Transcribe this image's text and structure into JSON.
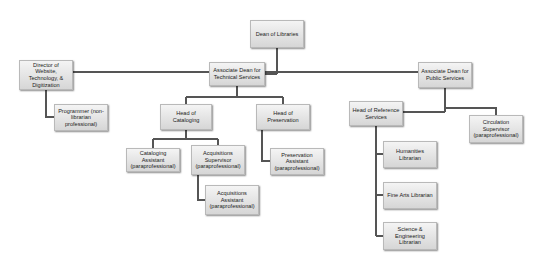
{
  "chart": {
    "line_color": "#555555",
    "box_fill_top": "#f4f4f4",
    "box_fill_bottom": "#d6d6d6",
    "nodes": {
      "dean": "Dean of Libraries",
      "director_web": "Director of Website, Technology, & Digitization",
      "programmer": "Programmer (non-librarian professional)",
      "assoc_dean_tech": "Associate Dean for Technical Services",
      "head_cataloging": "Head of Cataloging",
      "head_preservation": "Head of Preservation",
      "cataloging_assistant": "Cataloging Assistant (paraprofessional)",
      "acq_supervisor": "Acquisitions Supervisor (paraprofessional)",
      "preservation_assistant": "Preservation Assistant (paraprofessional)",
      "acq_assistant": "Acquisitions Assistant (paraprofessional)",
      "assoc_dean_public": "Associate Dean for Public Services",
      "head_reference": "Head of Reference Services",
      "circulation_supervisor": "Circulation Supervisor (paraprofessional)",
      "humanities_librarian": "Humanities Librarian",
      "fine_arts_librarian": "Fine Arts Librarian",
      "science_eng_librarian": "Science & Engineering Librarian"
    }
  }
}
